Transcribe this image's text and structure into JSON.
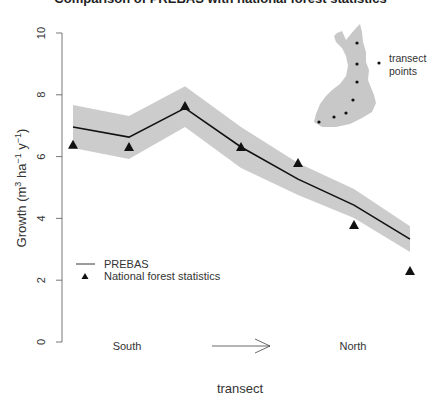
{
  "title": "Comparison of PREBAS with national forest statistics",
  "chart_data": {
    "type": "line",
    "title": "Comparison of PREBAS with national forest statistics",
    "xlabel": "transect",
    "ylabel": "Growth (m^3 ha^-1 y^-1)",
    "ylim": [
      0,
      10
    ],
    "yticks": [
      0,
      2,
      4,
      6,
      8,
      10
    ],
    "x_annotations": {
      "left": "South",
      "right": "North",
      "arrow": "South → North"
    },
    "x": [
      1,
      2,
      3,
      4,
      5,
      6,
      7
    ],
    "series": [
      {
        "name": "PREBAS",
        "style": "line",
        "values": [
          6.96,
          6.63,
          7.57,
          6.31,
          5.27,
          4.43,
          3.33
        ],
        "band_upper": [
          7.67,
          7.31,
          8.28,
          6.96,
          5.79,
          4.95,
          3.75
        ],
        "band_lower": [
          6.28,
          5.92,
          6.96,
          5.63,
          4.76,
          4.01,
          2.91
        ]
      },
      {
        "name": "National forest statistics",
        "style": "triangle",
        "values": [
          6.38,
          6.31,
          7.64,
          6.31,
          5.79,
          3.79,
          2.3
        ]
      }
    ],
    "legend": [
      "PREBAS",
      "National forest statistics"
    ],
    "legend_position": "bottom-left",
    "inset": {
      "description": "Map of Finland with transect points",
      "label": "transect points",
      "points": 7
    },
    "grid": false
  },
  "labels": {
    "ylabel_main": "Growth (m",
    "y_sup1": "3",
    "y_mid": " ha",
    "y_sup2": "−1",
    "y_mid2": " y",
    "y_sup3": "−1",
    "y_end": ")",
    "xlabel": "transect",
    "south": "South",
    "north": "North",
    "legend_prebas": "PREBAS",
    "legend_nfs": "National forest statistics",
    "inset_label_1": "transect",
    "inset_label_2": "points",
    "ticks": [
      "0",
      "2",
      "4",
      "6",
      "8",
      "10"
    ]
  }
}
